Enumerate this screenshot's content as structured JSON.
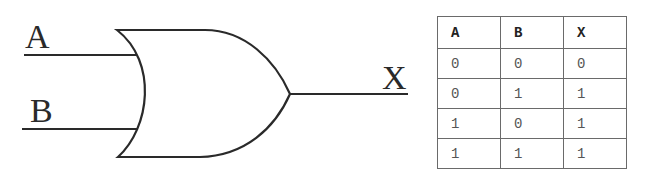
{
  "diagram": {
    "gate_type": "OR",
    "inputs": [
      {
        "label": "A"
      },
      {
        "label": "B"
      }
    ],
    "output": {
      "label": "X"
    },
    "colors": {
      "stroke": "#2a2a2a",
      "table_border": "#6a6a6a"
    }
  },
  "truth_table": {
    "headers": [
      "A",
      "B",
      "X"
    ],
    "rows": [
      [
        "0",
        "0",
        "0"
      ],
      [
        "0",
        "1",
        "1"
      ],
      [
        "1",
        "0",
        "1"
      ],
      [
        "1",
        "1",
        "1"
      ]
    ]
  }
}
